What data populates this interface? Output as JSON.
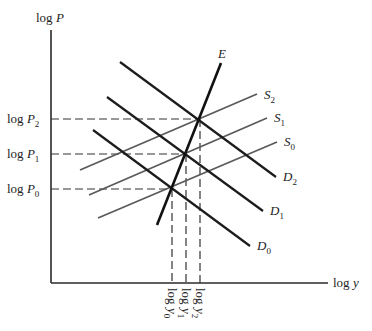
{
  "diagram": {
    "axes": {
      "y_label": "log P",
      "x_label": "log y"
    },
    "price_levels": [
      {
        "label": "log P",
        "sub": "0",
        "y": 189
      },
      {
        "label": "log P",
        "sub": "1",
        "y": 154
      },
      {
        "label": "log P",
        "sub": "2",
        "y": 119
      }
    ],
    "output_levels": [
      {
        "label": "log y",
        "sub": "0",
        "x": 172
      },
      {
        "label": "log y",
        "sub": "1",
        "x": 186
      },
      {
        "label": "log y",
        "sub": "2",
        "x": 200
      }
    ],
    "curves": {
      "expansion": {
        "label": "E"
      },
      "demand": [
        {
          "label": "D",
          "sub": "0"
        },
        {
          "label": "D",
          "sub": "1"
        },
        {
          "label": "D",
          "sub": "2"
        }
      ],
      "supply": [
        {
          "label": "S",
          "sub": "0"
        },
        {
          "label": "S",
          "sub": "1"
        },
        {
          "label": "S",
          "sub": "2"
        }
      ]
    }
  }
}
